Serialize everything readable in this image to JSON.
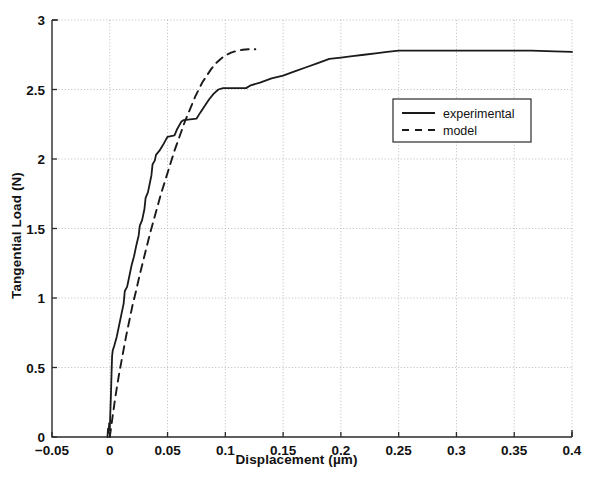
{
  "chart_data": {
    "type": "line",
    "title": "",
    "xlabel": "Displacement (µm)",
    "ylabel": "Tangential Load (N)",
    "xlim": [
      -0.05,
      0.4
    ],
    "ylim": [
      0,
      3
    ],
    "xticks": [
      -0.05,
      0,
      0.05,
      0.1,
      0.15,
      0.2,
      0.25,
      0.3,
      0.35,
      0.4
    ],
    "xticklabels": [
      "−0.05",
      "0",
      "0.05",
      "0.1",
      "0.15",
      "0.2",
      "0.25",
      "0.3",
      "0.35",
      "0.4"
    ],
    "yticks": [
      0,
      0.5,
      1,
      1.5,
      2,
      2.5,
      3
    ],
    "yticklabels": [
      "0",
      "0.5",
      "1",
      "1.5",
      "2",
      "2.5",
      "3"
    ],
    "grid": true,
    "grid_style": "dotted",
    "grid_color": "#b9b9b9",
    "legend_position": "center-right",
    "line_color": "#1a1a1a",
    "series": [
      {
        "name": "experimental",
        "style": "solid",
        "points": [
          [
            -0.002,
            0.0
          ],
          [
            -0.0015,
            0.06
          ],
          [
            -0.001,
            0.03
          ],
          [
            -0.0005,
            0.1
          ],
          [
            0.0,
            0.05
          ],
          [
            0.0005,
            0.18
          ],
          [
            0.001,
            0.3
          ],
          [
            0.0015,
            0.45
          ],
          [
            0.002,
            0.58
          ],
          [
            0.0025,
            0.62
          ],
          [
            0.004,
            0.66
          ],
          [
            0.006,
            0.72
          ],
          [
            0.008,
            0.8
          ],
          [
            0.01,
            0.88
          ],
          [
            0.012,
            0.96
          ],
          [
            0.013,
            1.05
          ],
          [
            0.015,
            1.08
          ],
          [
            0.017,
            1.16
          ],
          [
            0.019,
            1.24
          ],
          [
            0.021,
            1.3
          ],
          [
            0.023,
            1.38
          ],
          [
            0.025,
            1.45
          ],
          [
            0.026,
            1.52
          ],
          [
            0.028,
            1.56
          ],
          [
            0.03,
            1.64
          ],
          [
            0.031,
            1.72
          ],
          [
            0.033,
            1.76
          ],
          [
            0.035,
            1.84
          ],
          [
            0.036,
            1.88
          ],
          [
            0.037,
            1.96
          ],
          [
            0.039,
            1.99
          ],
          [
            0.04,
            2.03
          ],
          [
            0.043,
            2.06
          ],
          [
            0.046,
            2.1
          ],
          [
            0.048,
            2.13
          ],
          [
            0.05,
            2.16
          ],
          [
            0.056,
            2.17
          ],
          [
            0.058,
            2.21
          ],
          [
            0.06,
            2.24
          ],
          [
            0.062,
            2.27
          ],
          [
            0.064,
            2.28
          ],
          [
            0.075,
            2.29
          ],
          [
            0.078,
            2.33
          ],
          [
            0.082,
            2.38
          ],
          [
            0.086,
            2.43
          ],
          [
            0.09,
            2.47
          ],
          [
            0.094,
            2.5
          ],
          [
            0.098,
            2.51
          ],
          [
            0.118,
            2.51
          ],
          [
            0.122,
            2.53
          ],
          [
            0.13,
            2.55
          ],
          [
            0.14,
            2.58
          ],
          [
            0.15,
            2.6
          ],
          [
            0.16,
            2.63
          ],
          [
            0.17,
            2.66
          ],
          [
            0.18,
            2.69
          ],
          [
            0.19,
            2.72
          ],
          [
            0.2,
            2.73
          ],
          [
            0.21,
            2.74
          ],
          [
            0.22,
            2.75
          ],
          [
            0.23,
            2.76
          ],
          [
            0.24,
            2.77
          ],
          [
            0.25,
            2.78
          ],
          [
            0.28,
            2.78
          ],
          [
            0.31,
            2.78
          ],
          [
            0.34,
            2.78
          ],
          [
            0.365,
            2.78
          ],
          [
            0.385,
            2.775
          ],
          [
            0.4,
            2.77
          ]
        ]
      },
      {
        "name": "model",
        "style": "dashed",
        "points": [
          [
            0.0,
            0.0
          ],
          [
            0.002,
            0.12
          ],
          [
            0.004,
            0.24
          ],
          [
            0.006,
            0.35
          ],
          [
            0.008,
            0.45
          ],
          [
            0.01,
            0.54
          ],
          [
            0.012,
            0.63
          ],
          [
            0.014,
            0.72
          ],
          [
            0.016,
            0.8
          ],
          [
            0.018,
            0.88
          ],
          [
            0.02,
            0.96
          ],
          [
            0.023,
            1.06
          ],
          [
            0.026,
            1.17
          ],
          [
            0.029,
            1.27
          ],
          [
            0.032,
            1.37
          ],
          [
            0.035,
            1.47
          ],
          [
            0.038,
            1.56
          ],
          [
            0.041,
            1.65
          ],
          [
            0.044,
            1.74
          ],
          [
            0.047,
            1.82
          ],
          [
            0.05,
            1.9
          ],
          [
            0.053,
            1.98
          ],
          [
            0.056,
            2.06
          ],
          [
            0.059,
            2.13
          ],
          [
            0.062,
            2.2
          ],
          [
            0.065,
            2.27
          ],
          [
            0.068,
            2.33
          ],
          [
            0.071,
            2.39
          ],
          [
            0.074,
            2.45
          ],
          [
            0.077,
            2.5
          ],
          [
            0.08,
            2.55
          ],
          [
            0.084,
            2.6
          ],
          [
            0.088,
            2.65
          ],
          [
            0.092,
            2.69
          ],
          [
            0.096,
            2.72
          ],
          [
            0.1,
            2.745
          ],
          [
            0.105,
            2.765
          ],
          [
            0.11,
            2.778
          ],
          [
            0.115,
            2.786
          ],
          [
            0.12,
            2.79
          ],
          [
            0.126,
            2.79
          ]
        ]
      }
    ]
  },
  "legend": {
    "entries": [
      {
        "label": "experimental",
        "style": "solid"
      },
      {
        "label": "model",
        "style": "dashed"
      }
    ]
  }
}
